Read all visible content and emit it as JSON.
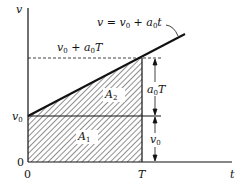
{
  "diagram": {
    "axis_y_label": "v",
    "axis_x_label": "t",
    "origin_y": "0",
    "origin_x": "0",
    "tick_v0": "v",
    "tick_v0_sub": "0",
    "tick_T": "T",
    "line_eq": "v = v",
    "line_eq_sub": "0",
    "line_eq_rest": " + a",
    "line_eq_sub2": "0",
    "line_eq_end": "t",
    "top_label": "v",
    "top_label_sub": "0",
    "top_label_mid": " + a",
    "top_label_sub2": "0",
    "top_label_end": "T",
    "area1": "A",
    "area1_sub": "1",
    "area2": "A",
    "area2_sub": "2",
    "dim_upper": "a",
    "dim_upper_sub": "0",
    "dim_upper_end": "T",
    "dim_lower": "v",
    "dim_lower_sub": "0"
  }
}
